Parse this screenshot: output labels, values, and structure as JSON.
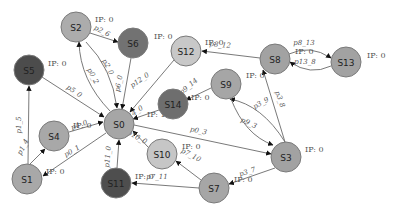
{
  "diagram": {
    "type": "directed-network",
    "colors": {
      "node_light": "#c4c4c4",
      "node_medium": "#9d9d9d",
      "node_dark": "#5e5e5e",
      "node_darker": "#4a4a4a",
      "edge": "#6a6a6a",
      "background": "#ffffff"
    },
    "nodes": [
      {
        "id": "S0",
        "label": "S0",
        "x": 119,
        "y": 124,
        "r": 15,
        "fill": "#a6a6a6",
        "ip": "IP: 1",
        "ip_x": 147,
        "ip_y": 117
      },
      {
        "id": "S1",
        "label": "S1",
        "x": 27,
        "y": 179,
        "r": 15,
        "fill": "#a8a8a8",
        "ip": "IP: 0",
        "ip_x": 46,
        "ip_y": 174
      },
      {
        "id": "S2",
        "label": "S2",
        "x": 76,
        "y": 27,
        "r": 15,
        "fill": "#acacac",
        "ip": "IP: 0",
        "ip_x": 95,
        "ip_y": 22
      },
      {
        "id": "S3",
        "label": "S3",
        "x": 286,
        "y": 157,
        "r": 15,
        "fill": "#a2a2a2",
        "ip": "IP: 0",
        "ip_x": 305,
        "ip_y": 152
      },
      {
        "id": "S4",
        "label": "S4",
        "x": 54,
        "y": 136,
        "r": 15,
        "fill": "#a8a8a8",
        "ip": "IP: 0",
        "ip_x": 73,
        "ip_y": 128
      },
      {
        "id": "S5",
        "label": "S5",
        "x": 29,
        "y": 70,
        "r": 15,
        "fill": "#4c4c4c",
        "ip": "IP: 0",
        "ip_x": 48,
        "ip_y": 66
      },
      {
        "id": "S6",
        "label": "S6",
        "x": 133,
        "y": 43,
        "r": 15,
        "fill": "#727272",
        "ip": "IP: 0",
        "ip_x": 154,
        "ip_y": 39
      },
      {
        "id": "S7",
        "label": "S7",
        "x": 214,
        "y": 188,
        "r": 15,
        "fill": "#a6a6a6",
        "ip": "IP: 0",
        "ip_x": 234,
        "ip_y": 182
      },
      {
        "id": "S8",
        "label": "S8",
        "x": 275,
        "y": 59,
        "r": 15,
        "fill": "#a2a2a2",
        "ip": "IP: 0",
        "ip_x": 295,
        "ip_y": 54
      },
      {
        "id": "S9",
        "label": "S9",
        "x": 226,
        "y": 84,
        "r": 15,
        "fill": "#a6a6a6",
        "ip": "IP: 0",
        "ip_x": 246,
        "ip_y": 78
      },
      {
        "id": "S10",
        "label": "S10",
        "x": 162,
        "y": 154,
        "r": 15,
        "fill": "#c6c6c6",
        "ip": "IP: 0",
        "ip_x": 182,
        "ip_y": 149
      },
      {
        "id": "S11",
        "label": "S11",
        "x": 116,
        "y": 183,
        "r": 15,
        "fill": "#4e4e4e",
        "ip": "IP: 0",
        "ip_x": 135,
        "ip_y": 179
      },
      {
        "id": "S12",
        "label": "S12",
        "x": 186,
        "y": 51,
        "r": 15,
        "fill": "#c8c8c8",
        "ip": "IP: 0",
        "ip_x": 205,
        "ip_y": 45
      },
      {
        "id": "S13",
        "label": "S13",
        "x": 346,
        "y": 62,
        "r": 15,
        "fill": "#a2a2a2",
        "ip": "IP: 0",
        "ip_x": 367,
        "ip_y": 58
      },
      {
        "id": "S14",
        "label": "S14",
        "x": 173,
        "y": 104,
        "r": 15,
        "fill": "#6e6e6e",
        "ip": "IP: 0",
        "ip_x": 191,
        "ip_y": 100
      }
    ],
    "edges": [
      {
        "id": "p2_6",
        "from": "S2",
        "to": "S6",
        "label": "p2_6",
        "lx": 101,
        "ly": 33,
        "rot": 28,
        "path": "M90,33 L118,42"
      },
      {
        "id": "p2_0",
        "from": "S2",
        "to": "S0",
        "label": "p2_0",
        "lx": 106,
        "ly": 68,
        "rot": 62,
        "path": "M86,42 Q112,68 117,108"
      },
      {
        "id": "p0_2",
        "from": "S0",
        "to": "S2",
        "label": "p0_2",
        "lx": 91,
        "ly": 77,
        "rot": 62,
        "path": "M110,111 Q80,80 79,42"
      },
      {
        "id": "p6_0",
        "from": "S6",
        "to": "S0",
        "label": "p6_0",
        "lx": 121,
        "ly": 84,
        "rot": -80,
        "path": "M131,58 L122,109"
      },
      {
        "id": "p12_0",
        "from": "S12",
        "to": "S0",
        "label": "p12_0",
        "lx": 141,
        "ly": 82,
        "rot": -35,
        "path": "M174,60 L130,112"
      },
      {
        "id": "p5_0",
        "from": "S5",
        "to": "S0",
        "label": "p5_0",
        "lx": 73,
        "ly": 93,
        "rot": 35,
        "path": "M42,77 L104,117"
      },
      {
        "id": "p14_0",
        "from": "S14",
        "to": "S0",
        "label": "p14_0",
        "lx": 135,
        "ly": 115,
        "rot": -35,
        "path": "M159,110 L133,119"
      },
      {
        "id": "p1_5",
        "from": "S1",
        "to": "S5",
        "label": "p1_5",
        "lx": 21,
        "ly": 125,
        "rot": -90,
        "path": "M28,164 L29,86"
      },
      {
        "id": "p1_4",
        "from": "S1",
        "to": "S4",
        "label": "p1_4",
        "lx": 25,
        "ly": 148,
        "rot": -62,
        "path": "M30,164 L45,149"
      },
      {
        "id": "p4_0",
        "from": "S4",
        "to": "S0",
        "label": "p4_0",
        "lx": 80,
        "ly": 127,
        "rot": -20,
        "path": "M69,132 L103,122"
      },
      {
        "id": "p0_1",
        "from": "S0",
        "to": "S1",
        "label": "p0_1",
        "lx": 73,
        "ly": 153,
        "rot": -30,
        "path": "M106,133 L43,176"
      },
      {
        "id": "p11_0",
        "from": "S11",
        "to": "S0",
        "label": "p11_0",
        "lx": 110,
        "ly": 157,
        "rot": -85,
        "path": "M117,168 L119,140"
      },
      {
        "id": "p10_0",
        "from": "S10",
        "to": "S0",
        "label": "p10_0",
        "lx": 136,
        "ly": 139,
        "rot": 30,
        "path": "M148,147 L133,131"
      },
      {
        "id": "p0_3",
        "from": "S0",
        "to": "S3",
        "label": "p0_3",
        "lx": 198,
        "ly": 133,
        "rot": 12,
        "path": "M134,125 L271,154"
      },
      {
        "id": "p8_12",
        "from": "S8",
        "to": "S12",
        "label": "p8_12",
        "lx": 220,
        "ly": 47,
        "rot": 5,
        "path": "M260,58 L202,51"
      },
      {
        "id": "p8_13",
        "from": "S8",
        "to": "S13",
        "label": "p8_13",
        "lx": 304,
        "ly": 45,
        "rot": 0,
        "path": "M289,54 Q310,44 331,58"
      },
      {
        "id": "p13_8",
        "from": "S13",
        "to": "S8",
        "label": "p13_8",
        "lx": 305,
        "ly": 64,
        "rot": 0,
        "path": "M331,66 Q310,76 290,62"
      },
      {
        "id": "p3_8",
        "from": "S3",
        "to": "S8",
        "label": "p3_8",
        "lx": 278,
        "ly": 100,
        "rot": 70,
        "path": "M285,142 L263,70"
      },
      {
        "id": "p3_9",
        "from": "S3",
        "to": "S9",
        "label": "p3_9",
        "lx": 262,
        "ly": 105,
        "rot": -30,
        "path": "M285,142 Q262,105 230,99"
      },
      {
        "id": "p9_3",
        "from": "S9",
        "to": "S3",
        "label": "p9_3",
        "lx": 248,
        "ly": 125,
        "rot": 25,
        "path": "M231,99 Q245,135 273,145"
      },
      {
        "id": "p9_14",
        "from": "S9",
        "to": "S14",
        "label": "p9_14",
        "lx": 190,
        "ly": 88,
        "rot": -40,
        "path": "M211,88 L186,100"
      },
      {
        "id": "p3_7",
        "from": "S3",
        "to": "S7",
        "label": "p3_7",
        "lx": 248,
        "ly": 174,
        "rot": -18,
        "path": "M275,168 L229,184"
      },
      {
        "id": "p7_10",
        "from": "S7",
        "to": "S10",
        "label": "p7_10",
        "lx": 190,
        "ly": 157,
        "rot": 28,
        "path": "M201,180 L176,161"
      },
      {
        "id": "p7_11",
        "from": "S7",
        "to": "S11",
        "label": "p7_11",
        "lx": 157,
        "ly": 179,
        "rot": 0,
        "path": "M199,188 L132,183"
      }
    ]
  }
}
